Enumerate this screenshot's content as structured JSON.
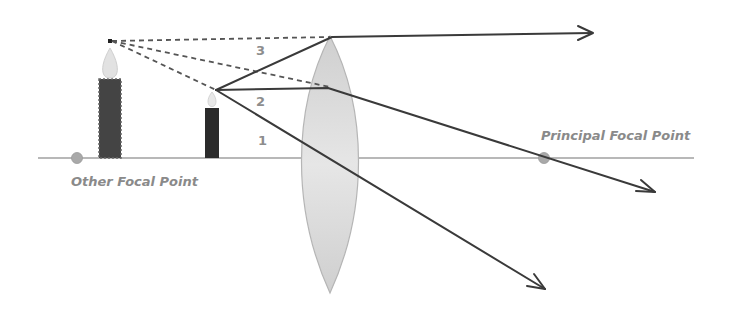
{
  "diagram": {
    "labels": {
      "principal_focal_point": "Principal Focal Point",
      "other_focal_point": "Other Focal Point"
    },
    "ray_numbers": [
      "3",
      "2",
      "1"
    ],
    "colors": {
      "ray": "#3a3a3a",
      "axis": "#9a9a9a",
      "lens_fill": "#d6d6d6",
      "lens_edge": "#b8b8b8",
      "candle": "#2b2b2b",
      "virtual_candle": "#444444",
      "focal_dot": "#a9a9a9",
      "label": "#8a8a8a"
    },
    "elements": {
      "object": "Candle (real object, inside focal length)",
      "image": "Candle (virtual, enlarged, upright image)",
      "lens": "Double convex lens"
    }
  }
}
